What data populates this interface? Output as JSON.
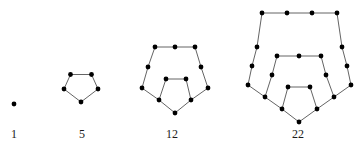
{
  "figure": {
    "background_color": "#ffffff",
    "dot_color": "#000000",
    "edge_color": "#3c3c3c",
    "label_color": "#1a1a1a",
    "dot_radius": 2.4,
    "edge_width": 0.8,
    "width": 358,
    "height": 147
  },
  "chart_data": {
    "type": "scatter",
    "xlabel": "",
    "ylabel": "",
    "categories": [
      "1",
      "5",
      "12",
      "22"
    ],
    "values": [
      1,
      5,
      12,
      22
    ],
    "series": [
      {
        "name": "pentagonal number",
        "values": [
          1,
          5,
          12,
          22
        ]
      },
      {
        "name": "dot count",
        "values": [
          1,
          5,
          12,
          22
        ]
      }
    ],
    "annotations": [
      "1",
      "5",
      "12",
      "22"
    ],
    "grid": false,
    "legend": "none"
  },
  "figures": [
    {
      "id": "figure-1",
      "label": "1",
      "dot_count": 1,
      "label_x": 14,
      "label_y": 128,
      "origin": {
        "x": 14,
        "y": 104
      },
      "rings": 0,
      "step": 0,
      "dots": [
        {
          "x": 14,
          "y": 104
        }
      ],
      "edges": []
    },
    {
      "id": "figure-5",
      "label": "5",
      "dot_count": 5,
      "label_x": 82,
      "label_y": 128,
      "origin": {
        "x": 64,
        "y": 89
      },
      "rings": 1,
      "step": 1,
      "dots": [
        {
          "x": 64,
          "y": 89
        },
        {
          "x": 70.5,
          "y": 74.5
        },
        {
          "x": 91.5,
          "y": 74.5
        },
        {
          "x": 98,
          "y": 89
        },
        {
          "x": 81,
          "y": 102
        }
      ],
      "edges": [
        [
          0,
          1
        ],
        [
          1,
          2
        ],
        [
          2,
          3
        ],
        [
          3,
          4
        ],
        [
          4,
          0
        ]
      ]
    },
    {
      "id": "figure-12",
      "label": "12",
      "dot_count": 12,
      "label_x": 172,
      "label_y": 128,
      "origin": {
        "x": 142,
        "y": 88
      },
      "rings": 2,
      "step": 2,
      "dots": [
        {
          "x": 142,
          "y": 88
        },
        {
          "x": 148,
          "y": 67
        },
        {
          "x": 155,
          "y": 47
        },
        {
          "x": 175,
          "y": 47
        },
        {
          "x": 195,
          "y": 47
        },
        {
          "x": 201,
          "y": 67
        },
        {
          "x": 208,
          "y": 88
        },
        {
          "x": 191,
          "y": 100
        },
        {
          "x": 175,
          "y": 113
        },
        {
          "x": 159,
          "y": 100
        },
        {
          "x": 166,
          "y": 79
        },
        {
          "x": 186,
          "y": 79
        }
      ],
      "edges": [
        [
          0,
          1
        ],
        [
          1,
          2
        ],
        [
          2,
          3
        ],
        [
          3,
          4
        ],
        [
          4,
          5
        ],
        [
          5,
          6
        ],
        [
          6,
          7
        ],
        [
          7,
          8
        ],
        [
          8,
          9
        ],
        [
          9,
          0
        ],
        [
          9,
          10
        ],
        [
          10,
          11
        ],
        [
          11,
          7
        ]
      ]
    },
    {
      "id": "figure-22",
      "label": "22",
      "dot_count": 22,
      "label_x": 298,
      "label_y": 128,
      "origin": {
        "x": 248,
        "y": 85
      },
      "rings": 3,
      "step": 3,
      "dots": [
        {
          "x": 248,
          "y": 85
        },
        {
          "x": 252,
          "y": 66
        },
        {
          "x": 257,
          "y": 47
        },
        {
          "x": 262,
          "y": 13
        },
        {
          "x": 287,
          "y": 13
        },
        {
          "x": 312,
          "y": 13
        },
        {
          "x": 337,
          "y": 13
        },
        {
          "x": 342,
          "y": 47
        },
        {
          "x": 347,
          "y": 66
        },
        {
          "x": 351,
          "y": 85
        },
        {
          "x": 334,
          "y": 97
        },
        {
          "x": 317,
          "y": 109
        },
        {
          "x": 299,
          "y": 122
        },
        {
          "x": 282,
          "y": 109
        },
        {
          "x": 265,
          "y": 97
        },
        {
          "x": 272,
          "y": 75
        },
        {
          "x": 277,
          "y": 56
        },
        {
          "x": 299,
          "y": 56
        },
        {
          "x": 321,
          "y": 56
        },
        {
          "x": 326,
          "y": 75
        },
        {
          "x": 310,
          "y": 87
        },
        {
          "x": 288,
          "y": 87
        }
      ],
      "edges": [
        [
          0,
          1
        ],
        [
          1,
          2
        ],
        [
          2,
          3
        ],
        [
          3,
          4
        ],
        [
          4,
          5
        ],
        [
          5,
          6
        ],
        [
          6,
          7
        ],
        [
          7,
          8
        ],
        [
          8,
          9
        ],
        [
          9,
          10
        ],
        [
          10,
          11
        ],
        [
          11,
          12
        ],
        [
          12,
          13
        ],
        [
          13,
          14
        ],
        [
          14,
          0
        ],
        [
          14,
          15
        ],
        [
          15,
          16
        ],
        [
          16,
          17
        ],
        [
          17,
          18
        ],
        [
          18,
          19
        ],
        [
          19,
          10
        ],
        [
          13,
          21
        ],
        [
          21,
          20
        ],
        [
          20,
          11
        ]
      ]
    }
  ]
}
